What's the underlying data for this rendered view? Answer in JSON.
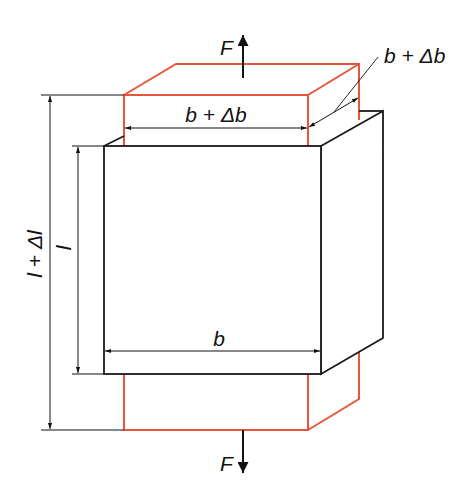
{
  "diagram": {
    "colors": {
      "original": "#1a1a1a",
      "deformed": "#e8553a",
      "dimension": "#111111"
    },
    "labels": {
      "force_top": "F",
      "force_bottom": "F",
      "length": "l",
      "length_deformed": "l + Δl",
      "width": "b",
      "width_deformed_front": "b + Δb",
      "width_deformed_depth": "b + Δb"
    }
  }
}
